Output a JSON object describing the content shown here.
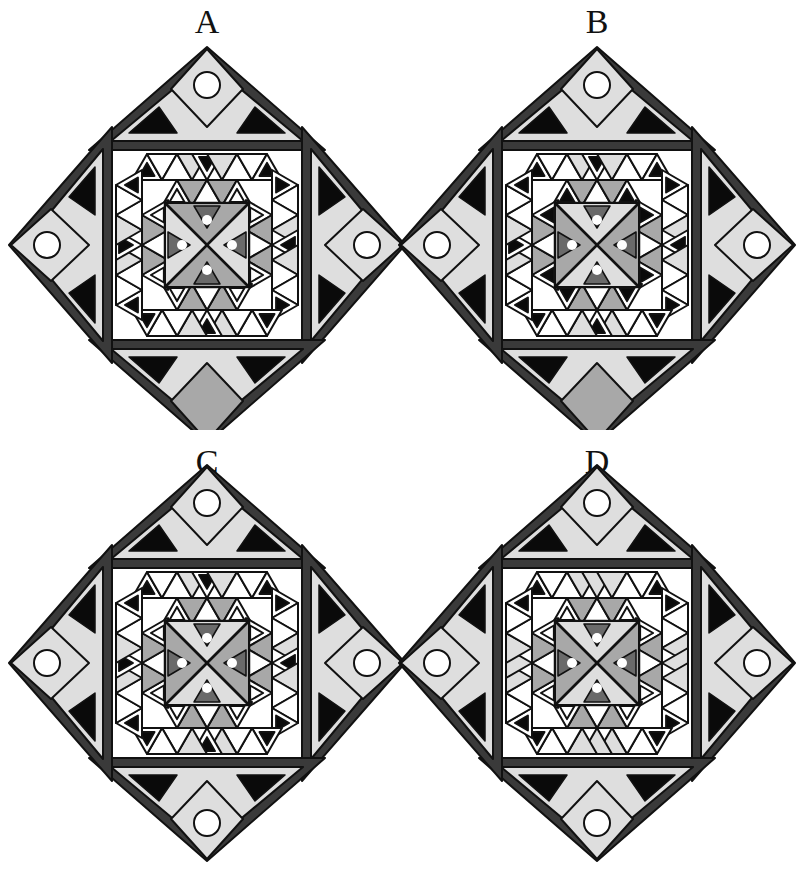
{
  "puzzle": {
    "options": [
      {
        "label": "A",
        "center": [
          207,
          245
        ],
        "label_top": 2,
        "variant": {
          "core_top_bottom": "gray",
          "core_sides": "light",
          "inner_small_triangles": "hollow",
          "strip_middle_black": true,
          "bottom_cap_circle": false
        }
      },
      {
        "label": "B",
        "center": [
          597,
          245
        ],
        "label_top": 2,
        "variant": {
          "core_top_bottom": "light",
          "core_sides": "gray",
          "inner_small_triangles": "black",
          "strip_middle_black": true,
          "bottom_cap_circle": false
        }
      },
      {
        "label": "C",
        "center": [
          207,
          663
        ],
        "label_top": 442,
        "variant": {
          "core_top_bottom": "light",
          "core_sides": "gray",
          "inner_small_triangles": "hollow",
          "strip_middle_black": true,
          "bottom_cap_circle": true
        }
      },
      {
        "label": "D",
        "center": [
          597,
          663
        ],
        "label_top": 442,
        "variant": {
          "core_top_bottom": "light",
          "core_sides": "gray",
          "inner_small_triangles": "hollow",
          "strip_middle_black": false,
          "bottom_cap_circle": true
        }
      }
    ]
  },
  "colors": {
    "background": "#ffffff",
    "outline": "#111111",
    "dark_band": "#3a3a3a",
    "gray": "#a8a8a8",
    "light": "#dedede",
    "white": "#ffffff",
    "black": "#0a0a0a"
  }
}
